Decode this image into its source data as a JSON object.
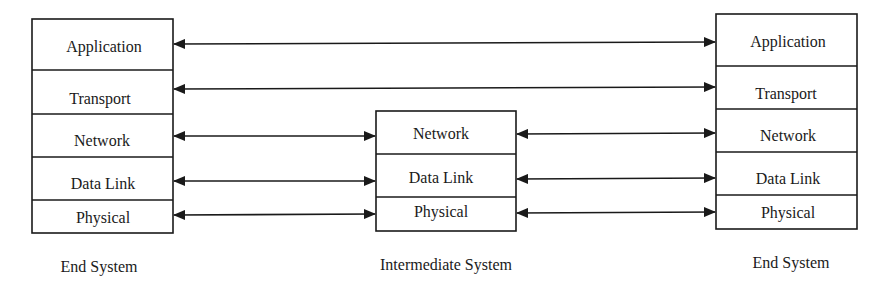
{
  "diagram": {
    "title": "",
    "systems": [
      {
        "id": "left",
        "caption": "End System",
        "layers": [
          "Application",
          "Transport",
          "Network",
          "Data Link",
          "Physical"
        ]
      },
      {
        "id": "middle",
        "caption": "Intermediate System",
        "layers": [
          "Network",
          "Data Link",
          "Physical"
        ]
      },
      {
        "id": "right",
        "caption": "End System",
        "layers": [
          "Application",
          "Transport",
          "Network",
          "Data Link",
          "Physical"
        ]
      }
    ],
    "connections": [
      {
        "from": "left.Application",
        "to": "right.Application",
        "type": "bidirectional"
      },
      {
        "from": "left.Transport",
        "to": "right.Transport",
        "type": "bidirectional"
      },
      {
        "from": "left.Network",
        "to": "middle.Network",
        "type": "bidirectional"
      },
      {
        "from": "left.Data Link",
        "to": "middle.Data Link",
        "type": "bidirectional"
      },
      {
        "from": "left.Physical",
        "to": "middle.Physical",
        "type": "bidirectional"
      },
      {
        "from": "middle.Network",
        "to": "right.Network",
        "type": "bidirectional"
      },
      {
        "from": "middle.Data Link",
        "to": "right.Data Link",
        "type": "bidirectional"
      },
      {
        "from": "middle.Physical",
        "to": "right.Physical",
        "type": "bidirectional"
      }
    ]
  }
}
